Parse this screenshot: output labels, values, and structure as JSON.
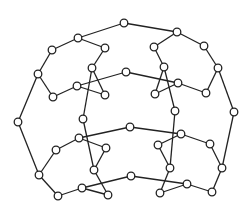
{
  "diagram": {
    "type": "graph",
    "colors": {
      "stroke": "#222222",
      "background": "#ffffff",
      "node_fill": "#ffffff"
    },
    "node_radius": 3.8,
    "nodes": [
      {
        "id": "A",
        "x": 124,
        "y": 23
      },
      {
        "id": "B",
        "x": 78,
        "y": 38
      },
      {
        "id": "C",
        "x": 52,
        "y": 50
      },
      {
        "id": "D",
        "x": 38,
        "y": 74
      },
      {
        "id": "D2",
        "x": 53,
        "y": 97
      },
      {
        "id": "E",
        "x": 18,
        "y": 122
      },
      {
        "id": "F",
        "x": 39,
        "y": 175
      },
      {
        "id": "G",
        "x": 58,
        "y": 196
      },
      {
        "id": "H",
        "x": 82,
        "y": 188
      },
      {
        "id": "I",
        "x": 108,
        "y": 195
      },
      {
        "id": "J",
        "x": 105,
        "y": 48
      },
      {
        "id": "K",
        "x": 92,
        "y": 68
      },
      {
        "id": "L",
        "x": 77,
        "y": 86
      },
      {
        "id": "M",
        "x": 105,
        "y": 95
      },
      {
        "id": "N",
        "x": 126,
        "y": 72
      },
      {
        "id": "O",
        "x": 83,
        "y": 119
      },
      {
        "id": "P",
        "x": 79,
        "y": 138
      },
      {
        "id": "Q",
        "x": 56,
        "y": 150
      },
      {
        "id": "R",
        "x": 106,
        "y": 148
      },
      {
        "id": "S",
        "x": 94,
        "y": 170
      },
      {
        "id": "T",
        "x": 177,
        "y": 32
      },
      {
        "id": "U",
        "x": 154,
        "y": 47
      },
      {
        "id": "V",
        "x": 204,
        "y": 46
      },
      {
        "id": "W",
        "x": 164,
        "y": 67
      },
      {
        "id": "X",
        "x": 218,
        "y": 68
      },
      {
        "id": "Z",
        "x": 178,
        "y": 83
      },
      {
        "id": "AA",
        "x": 155,
        "y": 94
      },
      {
        "id": "AB",
        "x": 206,
        "y": 93
      },
      {
        "id": "AC",
        "x": 175,
        "y": 111
      },
      {
        "id": "AD",
        "x": 234,
        "y": 112
      },
      {
        "id": "AE",
        "x": 130,
        "y": 127
      },
      {
        "id": "AF",
        "x": 181,
        "y": 134
      },
      {
        "id": "AG",
        "x": 158,
        "y": 145
      },
      {
        "id": "AH",
        "x": 210,
        "y": 144
      },
      {
        "id": "AI",
        "x": 170,
        "y": 168
      },
      {
        "id": "AJ",
        "x": 222,
        "y": 168
      },
      {
        "id": "AK",
        "x": 131,
        "y": 176
      },
      {
        "id": "AL",
        "x": 187,
        "y": 184
      },
      {
        "id": "AM",
        "x": 160,
        "y": 193
      },
      {
        "id": "AN",
        "x": 212,
        "y": 192
      }
    ],
    "edges": [
      [
        "A",
        "B"
      ],
      [
        "A",
        "T"
      ],
      [
        "B",
        "C"
      ],
      [
        "C",
        "D"
      ],
      [
        "D",
        "E"
      ],
      [
        "D",
        "D2"
      ],
      [
        "D2",
        "L"
      ],
      [
        "B",
        "J"
      ],
      [
        "J",
        "K"
      ],
      [
        "K",
        "M"
      ],
      [
        "K",
        "O"
      ],
      [
        "L",
        "N"
      ],
      [
        "L",
        "M"
      ],
      [
        "T",
        "U"
      ],
      [
        "T",
        "V"
      ],
      [
        "U",
        "W"
      ],
      [
        "V",
        "X"
      ],
      [
        "X",
        "AB"
      ],
      [
        "AB",
        "Z"
      ],
      [
        "N",
        "Z"
      ],
      [
        "W",
        "AA"
      ],
      [
        "AA",
        "Z"
      ],
      [
        "W",
        "AC"
      ],
      [
        "X",
        "AD"
      ],
      [
        "E",
        "F"
      ],
      [
        "F",
        "Q"
      ],
      [
        "Q",
        "P"
      ],
      [
        "P",
        "R"
      ],
      [
        "R",
        "S"
      ],
      [
        "O",
        "S"
      ],
      [
        "P",
        "AE"
      ],
      [
        "F",
        "G"
      ],
      [
        "G",
        "H"
      ],
      [
        "H",
        "I"
      ],
      [
        "H",
        "AK"
      ],
      [
        "S",
        "I"
      ],
      [
        "AE",
        "AF"
      ],
      [
        "AF",
        "AH"
      ],
      [
        "AH",
        "AJ"
      ],
      [
        "AJ",
        "AD"
      ],
      [
        "AJ",
        "AN"
      ],
      [
        "AN",
        "AL"
      ],
      [
        "AL",
        "AK"
      ],
      [
        "AF",
        "AG"
      ],
      [
        "AG",
        "AI"
      ],
      [
        "AI",
        "AM"
      ],
      [
        "AM",
        "AL"
      ],
      [
        "AC",
        "AI"
      ]
    ]
  }
}
